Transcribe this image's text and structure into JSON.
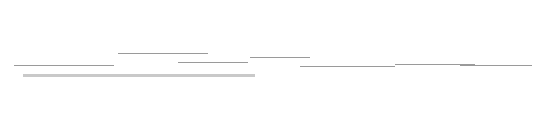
{
  "diagram": {
    "type": "cycling-peloton-humor",
    "labels": [
      {
        "id": "you",
        "lines": [
          "You"
        ]
      },
      {
        "id": "sat-on-back",
        "lines": [
          "Has sat on the",
          "back all day"
        ]
      },
      {
        "id": "obviously-dead",
        "lines": [
          "Obviously",
          "dead"
        ]
      },
      {
        "id": "apparently-dead",
        "lines": [
          "Apparently",
          "dead"
        ]
      },
      {
        "id": "very-strong",
        "lines": [
          "Very",
          "strong"
        ]
      },
      {
        "id": "actively-pulling",
        "lines": [
          "Actively",
          "Pulling"
        ]
      },
      {
        "id": "never-seen-jersey",
        "lines": [
          "You've never",
          "seen this jersey",
          "before"
        ]
      }
    ],
    "jersey_colors": [
      "#d9d9d9",
      "#7a7a7a",
      "#6e6e6e",
      "#cfcfcf",
      "#bdbdbd",
      "#2a2a2a",
      "#1f1f1f"
    ],
    "colors": {
      "track": "#c9c9c9",
      "ground": "#9a9a9a",
      "arrow": "#333333",
      "text": "#555555"
    }
  }
}
